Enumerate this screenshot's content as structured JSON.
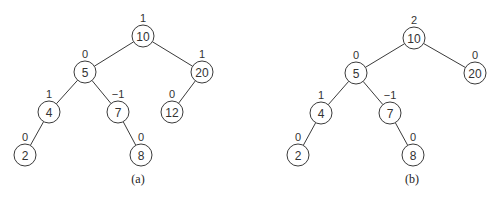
{
  "diagram": {
    "trees": [
      {
        "id": "a",
        "caption": "(a)",
        "caption_pos": [
          138,
          183
        ],
        "nodes": [
          {
            "key": "10",
            "bf": "1",
            "x": 143,
            "y": 36
          },
          {
            "key": "5",
            "bf": "0",
            "x": 85,
            "y": 72
          },
          {
            "key": "20",
            "bf": "1",
            "x": 202,
            "y": 72
          },
          {
            "key": "4",
            "bf": "1",
            "x": 49,
            "y": 112
          },
          {
            "key": "7",
            "bf": "−1",
            "x": 118,
            "y": 112
          },
          {
            "key": "12",
            "bf": "0",
            "x": 172,
            "y": 112
          },
          {
            "key": "2",
            "bf": "0",
            "x": 25,
            "y": 155
          },
          {
            "key": "8",
            "bf": "0",
            "x": 141,
            "y": 155
          }
        ],
        "edges": [
          [
            "10",
            "5"
          ],
          [
            "10",
            "20"
          ],
          [
            "5",
            "4"
          ],
          [
            "5",
            "7"
          ],
          [
            "20",
            "12"
          ],
          [
            "4",
            "2"
          ],
          [
            "7",
            "8"
          ]
        ]
      },
      {
        "id": "b",
        "caption": "(b)",
        "caption_pos": [
          412,
          183
        ],
        "nodes": [
          {
            "key": "10",
            "bf": "2",
            "x": 414,
            "y": 38
          },
          {
            "key": "5",
            "bf": "0",
            "x": 356,
            "y": 73
          },
          {
            "key": "20",
            "bf": "0",
            "x": 475,
            "y": 73
          },
          {
            "key": "4",
            "bf": "1",
            "x": 321,
            "y": 113
          },
          {
            "key": "7",
            "bf": "−1",
            "x": 390,
            "y": 113
          },
          {
            "key": "2",
            "bf": "0",
            "x": 298,
            "y": 155
          },
          {
            "key": "8",
            "bf": "0",
            "x": 413,
            "y": 155
          }
        ],
        "edges": [
          [
            "10",
            "5"
          ],
          [
            "10",
            "20"
          ],
          [
            "5",
            "4"
          ],
          [
            "5",
            "7"
          ],
          [
            "4",
            "2"
          ],
          [
            "7",
            "8"
          ]
        ]
      }
    ],
    "node_radius": 11
  }
}
